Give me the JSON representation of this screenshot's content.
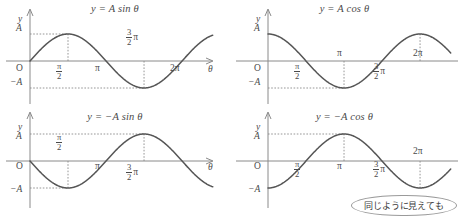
{
  "figure": {
    "background": "#ffffff",
    "curve_color": "#555555",
    "axis_color": "#8a8a8a",
    "text_color": "#4a4a4a",
    "dash_color": "#8a8a8a"
  },
  "labels": {
    "y_axis": "y",
    "x_axis": "θ",
    "origin": "O",
    "amp_pos": "A",
    "amp_neg": "−A",
    "pi": "π",
    "two_pi": "2π",
    "half_num": "π",
    "half_den": "2",
    "three_halves_num": "3",
    "three_halves_den": "2",
    "three_halves_tail": "π"
  },
  "panels": [
    {
      "id": "panel-a-sin",
      "title_y": "y",
      "title_eq": "=",
      "title_rhs": "A sin θ",
      "title": "y = A sin θ",
      "ticks": [
        "π/2",
        "π",
        "3π/2",
        "2π"
      ],
      "has_tick_pi": true,
      "has_tick_twopi": true,
      "halfpi_below": true,
      "threehalf_above": true
    },
    {
      "id": "panel-b-cos",
      "title_y": "y",
      "title_eq": "=",
      "title_rhs": "A cos θ",
      "title": "y = A cos θ",
      "ticks": [
        "π/2",
        "π",
        "3π/2",
        "2π"
      ],
      "has_tick_pi": true,
      "has_tick_twopi": true,
      "halfpi_below": true,
      "threehalf_below": true
    },
    {
      "id": "panel-c-neg-sin",
      "title_y": "y",
      "title_eq": "=",
      "title_rhs": "−A sin θ",
      "title": "y = −A sin θ",
      "ticks": [
        "π/2",
        "π",
        "3π/2"
      ],
      "has_tick_pi": true,
      "has_tick_twopi": false,
      "halfpi_above": true,
      "threehalf_below": true
    },
    {
      "id": "panel-d-neg-cos",
      "title_y": "y",
      "title_eq": "=",
      "title_rhs": "−A cos θ",
      "title": "y = −A cos θ",
      "ticks": [
        "π/2",
        "π",
        "3π/2",
        "2π"
      ],
      "has_tick_pi": true,
      "has_tick_twopi": true,
      "halfpi_below": true,
      "threehalf_below": true
    }
  ],
  "callout": {
    "text": "同じように見えても"
  },
  "chart_data": [
    {
      "type": "line",
      "title": "y = A sin θ",
      "xlabel": "θ",
      "ylabel": "y",
      "function": "A*sin(theta)",
      "amplitude": 1,
      "xlim": [
        -0.35,
        7.6
      ],
      "ylim": [
        -1.45,
        1.45
      ],
      "xticks": [
        1.5708,
        3.1416,
        4.7124,
        6.2832
      ],
      "xticklabels": [
        "π/2",
        "π",
        "3π/2",
        "2π"
      ],
      "yticks": [
        -1,
        0,
        1
      ],
      "yticklabels": [
        "−A",
        "O",
        "A"
      ],
      "guides": [
        {
          "type": "hline",
          "y": 1,
          "style": "dashed",
          "to_x": 1.5708
        },
        {
          "type": "hline",
          "y": -1,
          "style": "dashed",
          "to_x": 4.7124
        },
        {
          "type": "vline",
          "x": 1.5708,
          "style": "dashed"
        },
        {
          "type": "vline",
          "x": 4.7124,
          "style": "dashed"
        }
      ],
      "grid": false,
      "legend": false
    },
    {
      "type": "line",
      "title": "y = A cos θ",
      "xlabel": "θ",
      "ylabel": "y",
      "function": "A*cos(theta)",
      "amplitude": 1,
      "xlim": [
        -0.35,
        7.6
      ],
      "ylim": [
        -1.45,
        1.45
      ],
      "xticks": [
        1.5708,
        3.1416,
        4.7124,
        6.2832
      ],
      "xticklabels": [
        "π/2",
        "π",
        "3π/2",
        "2π"
      ],
      "yticks": [
        -1,
        0,
        1
      ],
      "yticklabels": [
        "−A",
        "O",
        "A"
      ],
      "guides": [
        {
          "type": "hline",
          "y": -1,
          "style": "dashed",
          "to_x": 3.1416
        },
        {
          "type": "vline",
          "x": 3.1416,
          "style": "dashed"
        },
        {
          "type": "vline",
          "x": 6.2832,
          "style": "dashed"
        }
      ],
      "grid": false,
      "legend": false
    },
    {
      "type": "line",
      "title": "y = −A sin θ",
      "xlabel": "θ",
      "ylabel": "y",
      "function": "-A*sin(theta)",
      "amplitude": 1,
      "xlim": [
        -0.35,
        7.6
      ],
      "ylim": [
        -1.45,
        1.45
      ],
      "xticks": [
        1.5708,
        3.1416,
        4.7124
      ],
      "xticklabels": [
        "π/2",
        "π",
        "3π/2"
      ],
      "yticks": [
        -1,
        0,
        1
      ],
      "yticklabels": [
        "−A",
        "O",
        "A"
      ],
      "guides": [
        {
          "type": "hline",
          "y": 1,
          "style": "dashed",
          "to_x": 4.7124
        },
        {
          "type": "hline",
          "y": -1,
          "style": "dashed",
          "to_x": 1.5708
        },
        {
          "type": "vline",
          "x": 1.5708,
          "style": "dashed"
        },
        {
          "type": "vline",
          "x": 4.7124,
          "style": "dashed"
        }
      ],
      "grid": false,
      "legend": false
    },
    {
      "type": "line",
      "title": "y = −A cos θ",
      "xlabel": "θ",
      "ylabel": "y",
      "function": "-A*cos(theta)",
      "amplitude": 1,
      "xlim": [
        -0.35,
        7.6
      ],
      "ylim": [
        -1.45,
        1.45
      ],
      "xticks": [
        1.5708,
        3.1416,
        4.7124,
        6.2832
      ],
      "xticklabels": [
        "π/2",
        "π",
        "3π/2",
        "2π"
      ],
      "yticks": [
        -1,
        0,
        1
      ],
      "yticklabels": [
        "−A",
        "O",
        "A"
      ],
      "guides": [
        {
          "type": "hline",
          "y": 1,
          "style": "dashed",
          "to_x": 3.1416
        },
        {
          "type": "vline",
          "x": 3.1416,
          "style": "dashed"
        },
        {
          "type": "vline",
          "x": 6.2832,
          "style": "dashed"
        }
      ],
      "grid": false,
      "legend": false
    }
  ]
}
